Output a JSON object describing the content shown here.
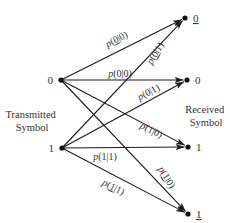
{
  "diagram": {
    "side_labels": {
      "transmitted": [
        "Transmitted",
        "Symbol"
      ],
      "received": [
        "Received",
        "Symbol"
      ]
    },
    "nodes": [
      {
        "id": "tx0",
        "label": "0",
        "underline": false,
        "x": 61,
        "y": 80,
        "label_side": "left"
      },
      {
        "id": "tx1",
        "label": "1",
        "underline": false,
        "x": 62,
        "y": 148,
        "label_side": "left"
      },
      {
        "id": "rx0u",
        "label": "0",
        "underline": true,
        "x": 185,
        "y": 18,
        "label_side": "right"
      },
      {
        "id": "rx0",
        "label": "0",
        "underline": false,
        "x": 187,
        "y": 80,
        "label_side": "right"
      },
      {
        "id": "rx1",
        "label": "1",
        "underline": false,
        "x": 188,
        "y": 147,
        "label_side": "right"
      },
      {
        "id": "rx1u",
        "label": "1",
        "underline": true,
        "x": 188,
        "y": 214,
        "label_side": "right"
      }
    ],
    "edges": [
      {
        "from": "tx0",
        "to": "rx0u",
        "label": [
          "p",
          "(",
          "0",
          "|0)"
        ],
        "underline_first": true,
        "lx": 118,
        "ly": 42,
        "angle": -27
      },
      {
        "from": "tx1",
        "to": "rx0u",
        "label": [
          "p",
          "(",
          "0",
          "|1)"
        ],
        "underline_first": true,
        "lx": 158,
        "ly": 55,
        "angle": -58
      },
      {
        "from": "tx0",
        "to": "rx0",
        "label": [
          "p",
          "(",
          "0",
          "|0)"
        ],
        "underline_first": false,
        "lx": 120,
        "ly": 77,
        "angle": 0
      },
      {
        "from": "tx1",
        "to": "rx0",
        "label": [
          "p",
          "(",
          "0",
          "|1)"
        ],
        "underline_first": false,
        "lx": 150,
        "ly": 95,
        "angle": -27
      },
      {
        "from": "tx0",
        "to": "rx1",
        "label": [
          "p",
          "(",
          "1",
          "|0)"
        ],
        "underline_first": false,
        "lx": 150,
        "ly": 133,
        "angle": 27
      },
      {
        "from": "tx1",
        "to": "rx1",
        "label": [
          "p",
          "(",
          "1",
          "|1)"
        ],
        "underline_first": false,
        "lx": 105,
        "ly": 160,
        "angle": 0
      },
      {
        "from": "tx0",
        "to": "rx1u",
        "label": [
          "p",
          "(",
          "1",
          "|0)"
        ],
        "underline_first": true,
        "lx": 164,
        "ly": 179,
        "angle": 58
      },
      {
        "from": "tx1",
        "to": "rx1u",
        "label": [
          "p",
          "(",
          "1",
          "|1)"
        ],
        "underline_first": true,
        "lx": 112,
        "ly": 190,
        "angle": 27
      }
    ]
  },
  "colors": {
    "line": "#1a1a1a",
    "text": "#333333",
    "background": "#ffffff"
  }
}
